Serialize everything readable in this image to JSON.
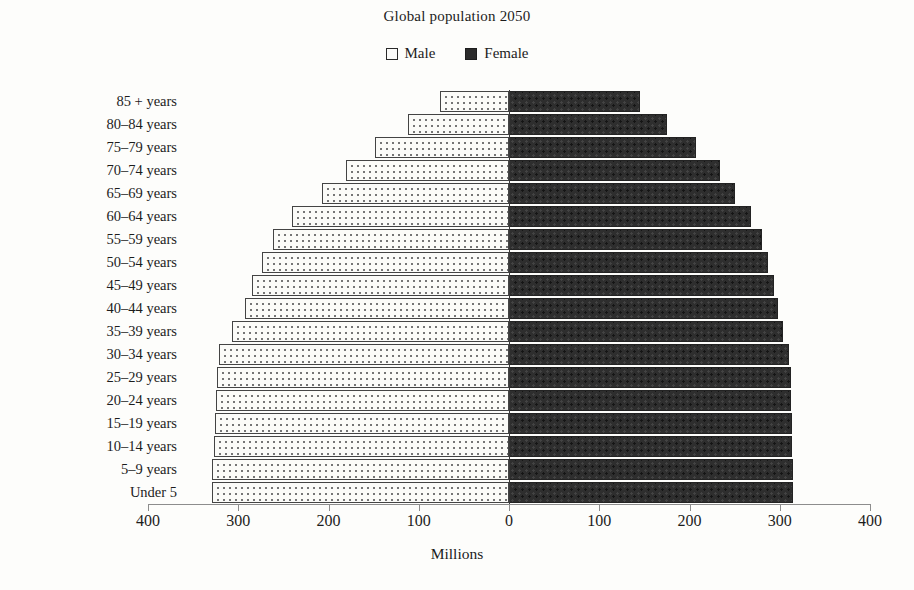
{
  "chart_data": {
    "type": "bar",
    "subtype": "population-pyramid",
    "title": "Global population 2050",
    "xlabel": "Millions",
    "ylabel": "",
    "grid": false,
    "legend_position": "top-center",
    "xlim": [
      -400,
      400
    ],
    "x_ticks": [
      "400",
      "300",
      "200",
      "100",
      "0",
      "100",
      "200",
      "300",
      "400"
    ],
    "x_tick_values": [
      -400,
      -300,
      -200,
      -100,
      0,
      100,
      200,
      300,
      400
    ],
    "categories": [
      "85 + years",
      "80–84 years",
      "75–79 years",
      "70–74 years",
      "65–69 years",
      "60–64 years",
      "55–59 years",
      "50–54 years",
      "45–49 years",
      "40–44 years",
      "35–39 years",
      "30–34 years",
      "25–29 years",
      "20–24 years",
      "15–19 years",
      "10–14 years",
      "5–9 years",
      "Under 5"
    ],
    "series": [
      {
        "name": "Male",
        "side": "left",
        "color": "#fbfbf8",
        "values": [
          76,
          112,
          148,
          181,
          207,
          240,
          262,
          274,
          285,
          292,
          307,
          321,
          324,
          325,
          326,
          327,
          329,
          329
        ]
      },
      {
        "name": "Female",
        "side": "right",
        "color": "#2e2e2e",
        "values": [
          145,
          175,
          207,
          234,
          250,
          268,
          280,
          287,
          294,
          298,
          304,
          310,
          312,
          313,
          314,
          314,
          315,
          315
        ]
      }
    ]
  },
  "legend": {
    "entries": [
      {
        "label": "Male",
        "marker": "open-square-icon"
      },
      {
        "label": "Female",
        "marker": "filled-square-icon"
      }
    ]
  },
  "axis": {
    "title": "Millions"
  }
}
